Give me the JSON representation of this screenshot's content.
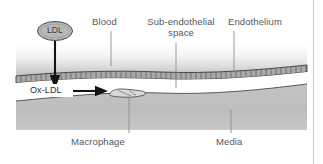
{
  "figure": {
    "background": "#ffffff",
    "border_color": "#c8c8c8"
  },
  "labels": {
    "blood": "Blood",
    "sub_endothelial_space": "Sub-endothelial\nspace",
    "sub_endothelial_line1": "Sub-endothelial",
    "sub_endothelial_line2": "space",
    "endothelium": "Endothelium",
    "macrophage": "Macrophage",
    "media": "Media",
    "ldl": "LDL",
    "ox_ldl": "Ox-LDL"
  },
  "particles": {
    "ldl_shape": "ellipse",
    "ldl_fill": "#b8b8b8",
    "ldl_stroke": "#4a4a4a"
  },
  "arrows": {
    "ldl_entry_arrow": "down-arrow",
    "ox_ldl_arrow": "right-arrow",
    "arrow_color": "#1a1a1a"
  },
  "layers": {
    "blood_fill_top": "#ffffff",
    "blood_fill_bottom": "#bfbfbf",
    "endothelium_fill": "#a9a9a9",
    "endothelium_stroke": "#3f3f3f",
    "sub_endothelial_fill": "#ffffff",
    "media_fill": "#bdbdbd",
    "media_stroke": "#4a4a4a"
  },
  "leader_lines": {
    "color": "#808080",
    "count": 5
  },
  "cells": {
    "macrophage_fill": "#d4d4d4",
    "macrophage_stroke": "#3c3c3c"
  }
}
